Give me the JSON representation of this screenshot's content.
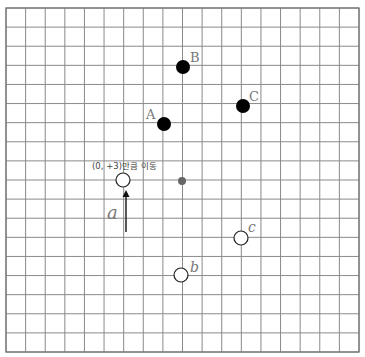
{
  "diagram": {
    "grid": {
      "left": 6,
      "top": 8,
      "right": 359,
      "bottom": 352,
      "cols": 18,
      "rows": 18,
      "line_color": "#8a8a8a"
    },
    "black_points": [
      {
        "label": "A",
        "x": 164,
        "y": 124,
        "label_x": 146,
        "label_y": 119
      },
      {
        "label": "B",
        "x": 183,
        "y": 67,
        "label_x": 190,
        "label_y": 62
      },
      {
        "label": "C",
        "x": 243,
        "y": 106,
        "label_x": 249,
        "label_y": 101
      }
    ],
    "center_point": {
      "x": 182,
      "y": 181,
      "color": "#666666"
    },
    "white_points": [
      {
        "label": "a",
        "x": 123,
        "y": 180
      },
      {
        "label": "b",
        "x": 181,
        "y": 275,
        "label_x": 190,
        "label_y": 272
      },
      {
        "label": "c",
        "x": 241,
        "y": 238,
        "label_x": 248,
        "label_y": 232
      }
    ],
    "arrow": {
      "x": 126,
      "y_start": 232,
      "y_end": 190
    },
    "arrow_label": {
      "text": "a",
      "x": 107,
      "y": 219
    },
    "translation_note": {
      "text": "(0, +3)만큼 이동",
      "x": 92,
      "y": 169
    },
    "labels": {
      "A": "A",
      "B": "B",
      "C": "C",
      "a": "a",
      "b": "b",
      "c": "c"
    }
  }
}
